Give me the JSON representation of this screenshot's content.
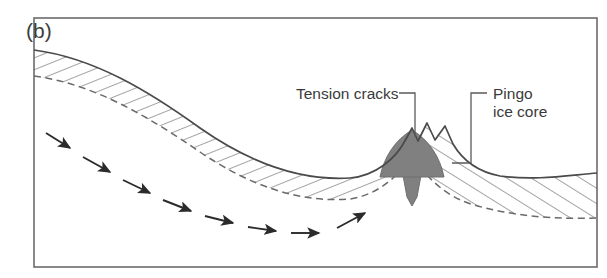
{
  "figure": {
    "panel_label": "(b)",
    "caption_subject": "pingo-formation-cross-section",
    "background_color": "#ffffff",
    "frame_color": "#6b6b6b"
  },
  "annotations": [
    {
      "id": "tension-cracks",
      "text": "Tension cracks",
      "lines": [
        "Tension cracks"
      ],
      "text_x": 296,
      "text_y": 99,
      "anchor": "start"
    },
    {
      "id": "pingo-ice-core",
      "text": "Pingo ice core",
      "lines": [
        "Pingo",
        "ice core"
      ],
      "text_x": 493,
      "text_y": 99,
      "anchor": "start"
    }
  ],
  "features": {
    "ground_surface_label": "ground-surface",
    "permafrost_layer_label": "permafrost-layer",
    "permafrost_base_label": "permafrost-base",
    "ice_core_label": "pingo-ice-core-body",
    "ice_core_color": "#808080",
    "groundwater_arrow_label": "groundwater-flow-arrow",
    "groundwater_arrow_count": 8,
    "tension_crack_count": 2
  },
  "geometry": {
    "frame": {
      "x": 34,
      "y": 18,
      "width": 563,
      "height": 249
    },
    "surface_path": "M 34,50 C 95,58 150,92 200,128 C 250,163 300,181 350,178 C 375,176 395,160 406,140 L 412,126 L 418,140 L 427,124 L 434,139 L 444,127 L 452,143 C 462,160 478,172 500,176 C 535,181 570,175 597,173",
    "base_path": "M 34,76 C 95,84 150,118 200,152 C 250,186 300,203 350,199 C 372,196 392,182 404,166 L 412,176 L 420,166 C 432,183 450,198 474,205 C 520,218 562,219 597,218",
    "ice_core_dome": "M 382,175 C 386,156 396,140 412,131 C 428,140 438,156 442,175 Z",
    "ice_core_stem": "M 404,172 L 420,172 L 417,196 L 412,204 L 407,196 Z",
    "arrows": [
      {
        "x1": 46,
        "y1": 133,
        "x2": 72,
        "y2": 149
      },
      {
        "x1": 83,
        "y1": 157,
        "x2": 112,
        "y2": 173
      },
      {
        "x1": 123,
        "y1": 180,
        "x2": 152,
        "y2": 194
      },
      {
        "x1": 163,
        "y1": 200,
        "x2": 193,
        "y2": 211
      },
      {
        "x1": 205,
        "y1": 216,
        "x2": 235,
        "y2": 223
      },
      {
        "x1": 248,
        "y1": 227,
        "x2": 278,
        "y2": 231
      },
      {
        "x1": 291,
        "y1": 233,
        "x2": 321,
        "y2": 233
      },
      {
        "x1": 337,
        "y1": 227,
        "x2": 367,
        "y2": 213
      }
    ],
    "leader_tension_cracks": "M 399,94 L 415,94 L 415,100 L 415,137",
    "leader_pingo_ice_core": "M 487,94 L 471,94 L 471,162 L 452,162",
    "hatch_left": {
      "count": 26,
      "description": "steep hatch lines between surface and base on the left limb"
    },
    "hatch_right": {
      "count": 13,
      "description": "opposite-tilt hatch lines on the right limb"
    }
  }
}
